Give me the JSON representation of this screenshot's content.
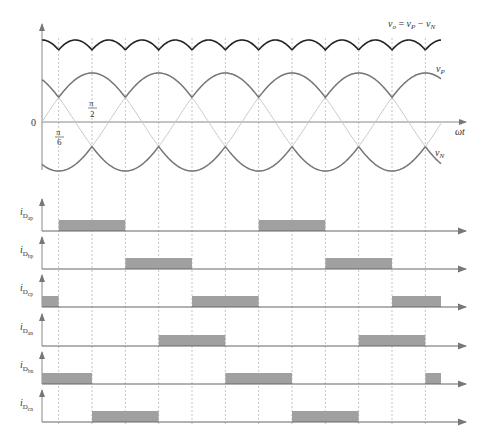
{
  "figure": {
    "labels": {
      "vo_equation_v": "v",
      "vo_equation_sub": "o",
      "vo_equation_eq": " = ",
      "vp_v": "v",
      "vp_sub": "P",
      "minus": " − ",
      "vn_v": "v",
      "vn_sub": "N",
      "vp_label_v": "v",
      "vp_label_sub": "P",
      "vn_label_v": "v",
      "vn_label_sub": "N",
      "omega_t": "ωt",
      "zero": "0",
      "pi": "π",
      "two": "2",
      "six": "6"
    },
    "currents": [
      {
        "label": "i",
        "sub1": "D",
        "sub2": "ap"
      },
      {
        "label": "i",
        "sub1": "D",
        "sub2": "bp"
      },
      {
        "label": "i",
        "sub1": "D",
        "sub2": "cp"
      },
      {
        "label": "i",
        "sub1": "D",
        "sub2": "an"
      },
      {
        "label": "i",
        "sub1": "D",
        "sub2": "bn"
      },
      {
        "label": "i",
        "sub1": "D",
        "sub2": "cn"
      }
    ]
  },
  "chart_data": {
    "type": "line",
    "title": "",
    "xlabel": "ωt",
    "x_ticks": [
      "0",
      "π/6",
      "π/2"
    ],
    "dashed_gridlines_rad": [
      "π/6",
      "π/2",
      "5π/6",
      "7π/6",
      "3π/2",
      "11π/6",
      "13π/6",
      "5π/2",
      "17π/6",
      "19π/6",
      "7π/2",
      "23π/6"
    ],
    "series": [
      {
        "name": "v_o = v_P − v_N",
        "description": "six-pulse rectified ripple, top trace"
      },
      {
        "name": "v_P",
        "description": "upper envelope of three-phase sines"
      },
      {
        "name": "v_N",
        "description": "lower envelope of three-phase sines"
      },
      {
        "name": "phase a",
        "phase_deg": 0
      },
      {
        "name": "phase b",
        "phase_deg": -120
      },
      {
        "name": "phase c",
        "phase_deg": 120
      }
    ],
    "conduction_intervals_rad": {
      "i_Dap": [
        [
          "π/6",
          "5π/6"
        ],
        [
          "13π/6",
          "17π/6"
        ]
      ],
      "i_Dbp": [
        [
          "5π/6",
          "3π/2"
        ],
        [
          "17π/6",
          "7π/2"
        ]
      ],
      "i_Dcp": [
        [
          "0",
          "π/6"
        ],
        [
          "3π/2",
          "13π/6"
        ],
        [
          "7π/2",
          "4π"
        ]
      ],
      "i_Dan": [
        [
          "7π/6",
          "11π/6"
        ],
        [
          "19π/6",
          "23π/6"
        ]
      ],
      "i_Dbn": [
        [
          "0",
          "π/2"
        ],
        [
          "11π/6",
          "5π/2"
        ],
        [
          "23π/6",
          "4π"
        ]
      ],
      "i_Dcn": [
        [
          "π/2",
          "7π/6"
        ],
        [
          "5π/2",
          "19π/6"
        ]
      ]
    },
    "x_range_rad": [
      0,
      "4π"
    ],
    "grid": false,
    "legend": "inline labels"
  }
}
